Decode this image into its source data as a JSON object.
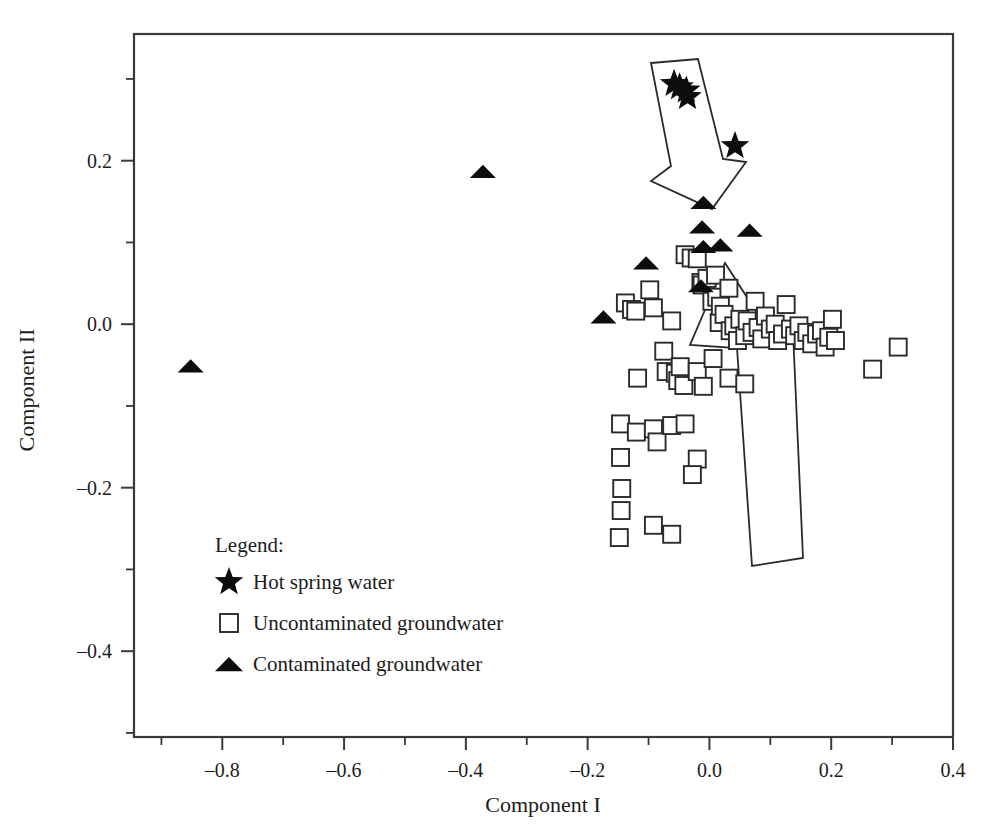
{
  "chart_data": {
    "type": "scatter",
    "title": "",
    "xlabel": "Component I",
    "ylabel": "Component II",
    "xlim": [
      -0.945,
      0.4
    ],
    "ylim": [
      -0.505,
      0.355
    ],
    "grid": false,
    "legend_position": "lower-left-inside",
    "xticks": [
      -0.8,
      -0.6,
      -0.4,
      -0.2,
      0.0,
      0.2,
      0.4
    ],
    "xticklabels": [
      "–0.8",
      "–0.6",
      "–0.4",
      "–0.2",
      "0.0",
      "0.2",
      "0.4"
    ],
    "xticks_minor": [
      -0.9,
      -0.7,
      -0.5,
      -0.3,
      -0.1,
      0.1,
      0.3
    ],
    "yticks": [
      0.2,
      0.0,
      -0.2,
      -0.4
    ],
    "yticklabels": [
      "0.2",
      "0.0",
      "–0.2",
      "–0.4"
    ],
    "yticks_minor": [
      0.3,
      0.1,
      -0.1,
      -0.3,
      -0.5
    ],
    "series": [
      {
        "name": "Hot spring water",
        "marker": "star",
        "color": "#0d0d0d",
        "points": [
          [
            -0.058,
            0.294
          ],
          [
            -0.049,
            0.29
          ],
          [
            -0.038,
            0.286
          ],
          [
            -0.036,
            0.278
          ],
          [
            0.042,
            0.218
          ]
        ]
      },
      {
        "name": "Uncontaminated groundwater",
        "marker": "open-square",
        "color": "#2b2b2b",
        "points": [
          [
            -0.138,
            0.026
          ],
          [
            -0.128,
            0.018
          ],
          [
            -0.121,
            0.016
          ],
          [
            -0.098,
            0.042
          ],
          [
            -0.092,
            0.02
          ],
          [
            -0.075,
            -0.033
          ],
          [
            -0.062,
            0.004
          ],
          [
            -0.04,
            0.085
          ],
          [
            -0.03,
            0.081
          ],
          [
            -0.02,
            0.08
          ],
          [
            -0.014,
            0.051
          ],
          [
            -0.012,
            0.048
          ],
          [
            -0.004,
            0.056
          ],
          [
            0.004,
            0.028
          ],
          [
            0.01,
            0.06
          ],
          [
            0.012,
            0.033
          ],
          [
            0.016,
            0.002
          ],
          [
            0.018,
            0.022
          ],
          [
            0.024,
            0.012
          ],
          [
            0.032,
            0.044
          ],
          [
            0.034,
            -0.008
          ],
          [
            0.04,
            -0.002
          ],
          [
            0.046,
            -0.02
          ],
          [
            0.05,
            0.006
          ],
          [
            0.058,
            -0.014
          ],
          [
            0.062,
            0.004
          ],
          [
            0.07,
            -0.01
          ],
          [
            0.075,
            0.028
          ],
          [
            0.08,
            -0.004
          ],
          [
            0.086,
            -0.018
          ],
          [
            0.092,
            0.01
          ],
          [
            0.1,
            -0.006
          ],
          [
            0.108,
            0.0
          ],
          [
            0.112,
            -0.02
          ],
          [
            0.12,
            -0.012
          ],
          [
            0.126,
            0.024
          ],
          [
            0.133,
            -0.006
          ],
          [
            0.14,
            -0.014
          ],
          [
            0.147,
            -0.002
          ],
          [
            0.154,
            -0.02
          ],
          [
            0.16,
            -0.01
          ],
          [
            0.168,
            -0.024
          ],
          [
            0.176,
            -0.012
          ],
          [
            0.184,
            -0.008
          ],
          [
            0.19,
            -0.028
          ],
          [
            0.196,
            -0.016
          ],
          [
            0.202,
            0.006
          ],
          [
            0.207,
            -0.02
          ],
          [
            0.268,
            -0.055
          ],
          [
            0.31,
            -0.028
          ],
          [
            -0.118,
            -0.066
          ],
          [
            -0.071,
            -0.058
          ],
          [
            -0.056,
            -0.06
          ],
          [
            -0.052,
            -0.069
          ],
          [
            -0.048,
            -0.052
          ],
          [
            -0.042,
            -0.075
          ],
          [
            -0.02,
            -0.058
          ],
          [
            -0.01,
            -0.076
          ],
          [
            0.006,
            -0.042
          ],
          [
            0.032,
            -0.066
          ],
          [
            0.058,
            -0.073
          ],
          [
            -0.146,
            -0.122
          ],
          [
            -0.12,
            -0.132
          ],
          [
            -0.092,
            -0.128
          ],
          [
            -0.086,
            -0.144
          ],
          [
            -0.062,
            -0.124
          ],
          [
            -0.04,
            -0.122
          ],
          [
            -0.02,
            -0.165
          ],
          [
            -0.146,
            -0.163
          ],
          [
            -0.144,
            -0.201
          ],
          [
            -0.028,
            -0.184
          ],
          [
            -0.145,
            -0.228
          ],
          [
            -0.148,
            -0.261
          ],
          [
            -0.062,
            -0.257
          ],
          [
            -0.092,
            -0.246
          ]
        ]
      },
      {
        "name": "Contaminated groundwater",
        "marker": "filled-triangle",
        "color": "#0d0d0d",
        "points": [
          [
            -0.852,
            -0.052
          ],
          [
            -0.372,
            0.186
          ],
          [
            -0.174,
            0.008
          ],
          [
            -0.104,
            0.074
          ],
          [
            -0.01,
            0.148
          ],
          [
            -0.012,
            0.118
          ],
          [
            0.066,
            0.114
          ],
          [
            -0.01,
            0.094
          ],
          [
            0.018,
            0.096
          ],
          [
            -0.014,
            0.046
          ]
        ]
      }
    ],
    "annotations": [
      {
        "name": "downward-arrow-hot-spring",
        "shape": "arrow",
        "points_px": [
          [
            651,
            63
          ],
          [
            698,
            59
          ],
          [
            723,
            159
          ],
          [
            746,
            162
          ],
          [
            712,
            209
          ],
          [
            651,
            181
          ],
          [
            671,
            166
          ]
        ]
      },
      {
        "name": "upward-arrow-groundwater",
        "shape": "arrow",
        "points_px": [
          [
            725,
            263
          ],
          [
            690,
            345
          ],
          [
            737,
            348
          ],
          [
            752,
            566
          ],
          [
            803,
            558
          ],
          [
            793,
            332
          ],
          [
            766,
            327
          ]
        ]
      }
    ]
  },
  "legend": {
    "title": "Legend:",
    "entries": [
      {
        "label": "Hot spring water",
        "marker": "star"
      },
      {
        "label": "Uncontaminated groundwater",
        "marker": "open-square"
      },
      {
        "label": "Contaminated groundwater",
        "marker": "filled-triangle"
      }
    ]
  },
  "axes": {
    "x_title": "Component I",
    "y_title": "Component II"
  }
}
